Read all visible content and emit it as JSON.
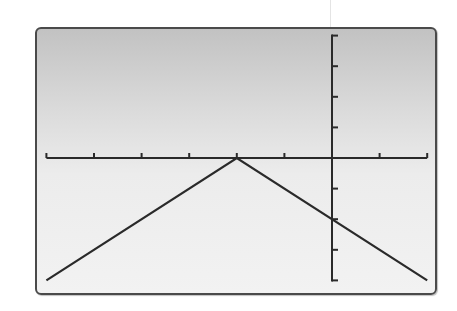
{
  "chart_data": {
    "type": "line",
    "title": "",
    "xlabel": "",
    "ylabel": "",
    "function": "y = -|x + 2|",
    "xlim": [
      -6,
      2
    ],
    "ylim": [
      -4,
      4
    ],
    "x_tick_step": 1,
    "y_tick_step": 1,
    "grid": false,
    "legend": null,
    "series": [
      {
        "name": "y = -|x + 2|",
        "x": [
          -6,
          -2,
          2
        ],
        "y": [
          -4,
          0,
          -4
        ]
      }
    ],
    "vertex": {
      "x": -2,
      "y": 0
    },
    "y_intercept": -2
  },
  "display": {
    "frame_color": "#4a4a4a",
    "axis_color": "#2a2a2a",
    "line_color": "#2a2a2a",
    "background_top": "#c2c2c2",
    "background_bottom": "#f2f2f2"
  }
}
